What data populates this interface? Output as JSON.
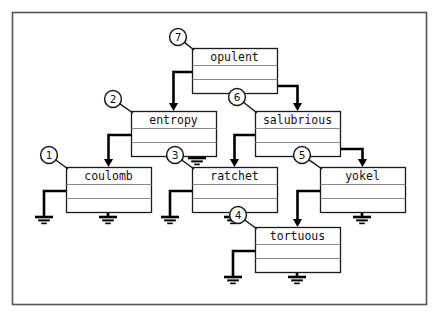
{
  "figure": {
    "kind": "hierarchy-block-diagram",
    "frame": {
      "x": 12,
      "y": 12,
      "width": 414,
      "height": 292,
      "stroke": "#4a4a4a"
    },
    "colors": {
      "box_border": "#1a1a1a",
      "box_inner_rule": "#8a8a8a",
      "wire": "#000000",
      "callout_circle": "#1a1a1a",
      "frame": "#555555",
      "background": "#ffffff"
    },
    "box_geometry": {
      "width": 85,
      "header_height": 17,
      "row_height": 14,
      "rows": 2
    }
  },
  "boxes": [
    {
      "id": "opulent",
      "label": "opulent",
      "x": 192,
      "y": 48,
      "callout": "7"
    },
    {
      "id": "entropy",
      "label": "entropy",
      "x": 131,
      "y": 111,
      "callout": "2"
    },
    {
      "id": "salubrious",
      "label": "salubrious",
      "x": 255,
      "y": 111,
      "callout": "6"
    },
    {
      "id": "coulomb",
      "label": "coulomb",
      "x": 66,
      "y": 167,
      "callout": "1"
    },
    {
      "id": "ratchet",
      "label": "ratchet",
      "x": 192,
      "y": 167,
      "callout": "3"
    },
    {
      "id": "yokel",
      "label": "yokel",
      "x": 320,
      "y": 167,
      "callout": "5"
    },
    {
      "id": "tortuous",
      "label": "tortuous",
      "x": 255,
      "y": 227,
      "callout": "4"
    }
  ],
  "callouts": [
    {
      "number": "1",
      "cx": 49,
      "cy": 155,
      "tip_x": 68,
      "tip_y": 169
    },
    {
      "number": "2",
      "cx": 113,
      "cy": 99,
      "tip_x": 133,
      "tip_y": 113
    },
    {
      "number": "3",
      "cx": 175,
      "cy": 155,
      "tip_x": 194,
      "tip_y": 169
    },
    {
      "number": "4",
      "cx": 238,
      "cy": 215,
      "tip_x": 257,
      "tip_y": 229
    },
    {
      "number": "5",
      "cx": 302,
      "cy": 155,
      "tip_x": 322,
      "tip_y": 169
    },
    {
      "number": "6",
      "cx": 237,
      "cy": 97,
      "tip_x": 257,
      "tip_y": 113
    },
    {
      "number": "7",
      "cx": 178,
      "cy": 37,
      "tip_x": 194,
      "tip_y": 50
    }
  ],
  "connections": [
    {
      "from": "opulent",
      "from_row": 1,
      "to": "entropy",
      "label": "opulent-row1 to entropy"
    },
    {
      "from": "opulent",
      "from_row": 2,
      "to": "salubrious",
      "label": "opulent-row2 to salubrious"
    },
    {
      "from": "entropy",
      "from_row": 1,
      "to": "coulomb",
      "label": "entropy-row1 to coulomb"
    },
    {
      "from": "salubrious",
      "from_row": 1,
      "to": "ratchet",
      "label": "salubrious-row1 to ratchet"
    },
    {
      "from": "salubrious",
      "from_row": 2,
      "to": "yokel",
      "label": "salubrious-row2 to yokel"
    },
    {
      "from": "yokel",
      "from_row": 1,
      "to": "tortuous",
      "label": "yokel-row1 to tortuous"
    }
  ],
  "grounds": [
    {
      "owner": "entropy",
      "row": 2,
      "x": 197,
      "y": 158
    },
    {
      "owner": "coulomb",
      "row": 1,
      "x": 44,
      "y": 217
    },
    {
      "owner": "coulomb",
      "row": 2,
      "x": 108,
      "y": 217
    },
    {
      "owner": "ratchet",
      "row": 1,
      "x": 170,
      "y": 217
    },
    {
      "owner": "ratchet",
      "row": 2,
      "x": 233,
      "y": 217
    },
    {
      "owner": "yokel",
      "row": 2,
      "x": 362,
      "y": 217
    },
    {
      "owner": "tortuous",
      "row": 1,
      "x": 233,
      "y": 277
    },
    {
      "owner": "tortuous",
      "row": 2,
      "x": 297,
      "y": 277
    }
  ]
}
